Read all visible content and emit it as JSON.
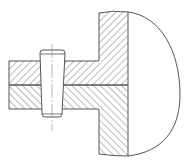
{
  "diagram": {
    "kind": "mechanical-section-drawing",
    "colors": {
      "background": "#ffffff",
      "outline": "#555555",
      "hatch": "#6a6a6a",
      "centerline": "#888888"
    },
    "parts": [
      {
        "name": "upper-part",
        "hatch": "forward-slash",
        "description": "shaft upper half and flange upper half"
      },
      {
        "name": "lower-part",
        "hatch": "back-slash",
        "description": "shaft lower half and flange lower half"
      },
      {
        "name": "taper-pin",
        "hatch": "none",
        "description": "tapered pin inserted through both parts"
      },
      {
        "name": "dome",
        "hatch": "none",
        "description": "rounded body to the right of the flange"
      }
    ]
  }
}
